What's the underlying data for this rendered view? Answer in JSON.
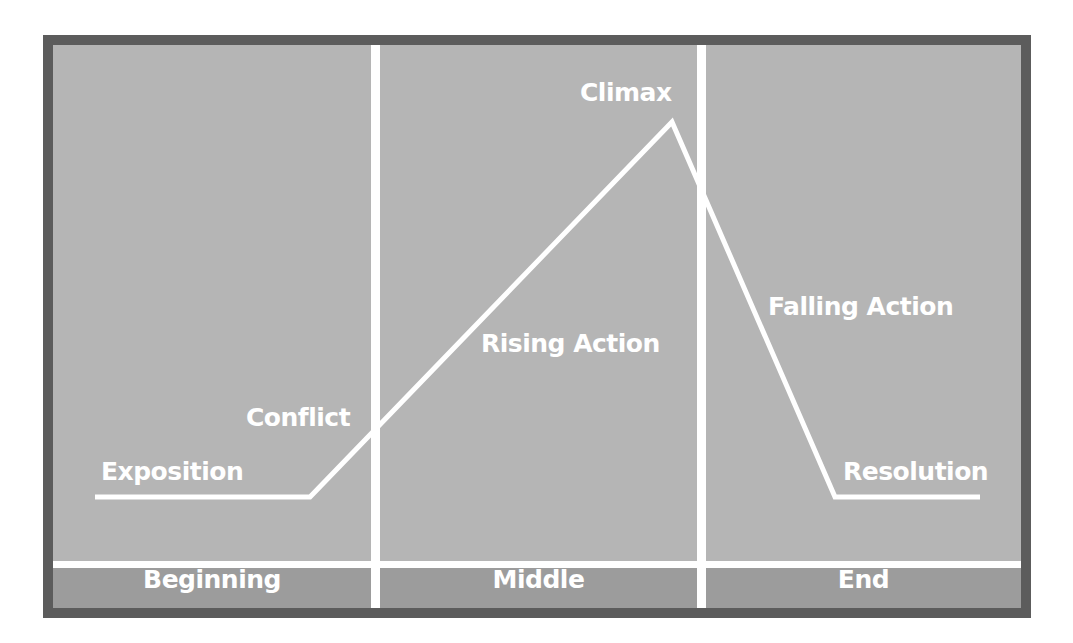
{
  "diagram": {
    "stages": {
      "exposition": "Exposition",
      "conflict": "Conflict",
      "rising_action": "Rising Action",
      "climax": "Climax",
      "falling_action": "Falling Action",
      "resolution": "Resolution"
    },
    "sections": {
      "beginning": "Beginning",
      "middle": "Middle",
      "end": "End"
    },
    "plot_line_points": [
      [
        95,
        497
      ],
      [
        310,
        497
      ],
      [
        672,
        122
      ],
      [
        835,
        497
      ],
      [
        980,
        497
      ]
    ],
    "colors": {
      "background": "#b5b5b5",
      "border": "#5c5c5c",
      "band": "#9c9c9c",
      "line": "#ffffff",
      "text": "#ffffff"
    }
  }
}
